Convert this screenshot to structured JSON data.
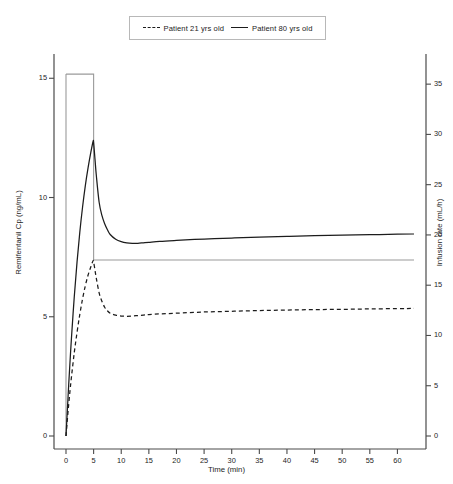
{
  "legend": {
    "position": "top-center",
    "entries": [
      {
        "label": "Patient 21 yrs old",
        "style": "dashed"
      },
      {
        "label": "Patient 80 yrs old",
        "style": "solid"
      }
    ]
  },
  "axes": {
    "x": {
      "label": "Time (min)",
      "ticks": [
        "0",
        "5",
        "10",
        "15",
        "20",
        "25",
        "30",
        "35",
        "40",
        "45",
        "50",
        "55",
        "60"
      ],
      "min": 0,
      "max": 63
    },
    "y_left": {
      "label": "Remifentanil Cp (ng/mL)",
      "ticks": [
        "0",
        "5",
        "10",
        "15"
      ],
      "min": 0,
      "max": 15.85
    },
    "y_right": {
      "label": "Infusion rate (mL/h)",
      "ticks": [
        "0",
        "5",
        "10",
        "15",
        "20",
        "25",
        "30",
        "35"
      ],
      "min": 0,
      "max": 37.6
    }
  },
  "colors": {
    "curve": "#1c1c1c",
    "infusion": "#9a9a9a",
    "axis": "#4a4a4a",
    "legend_border": "#b8b8b8",
    "background": "#ffffff"
  },
  "chart_data": {
    "type": "line",
    "title": "",
    "xlabel": "Time (min)",
    "ylabel": "Remifentanil Cp (ng/mL)",
    "ylabel_secondary": "Infusion rate (mL/h)",
    "xlim": [
      0,
      63
    ],
    "ylim": [
      0,
      15.85
    ],
    "ylim_secondary": [
      0,
      37.6
    ],
    "grid": false,
    "legend_position": "top-center",
    "series": [
      {
        "name": "Patient 80 yrs old",
        "style": "solid",
        "axis": "left",
        "units": "ng/mL",
        "x": [
          0,
          0.25,
          0.5,
          0.75,
          1,
          1.5,
          2,
          2.5,
          3,
          3.5,
          4,
          4.5,
          4.9,
          5,
          5.25,
          5.5,
          6,
          6.5,
          7,
          7.5,
          8,
          9,
          10,
          11,
          12,
          13,
          14,
          15,
          17,
          20,
          25,
          30,
          35,
          40,
          45,
          50,
          55,
          60,
          63
        ],
        "y": [
          0,
          1.1,
          2.2,
          3.2,
          4.15,
          5.85,
          7.3,
          8.55,
          9.6,
          10.5,
          11.25,
          11.9,
          12.35,
          12.3,
          11.6,
          10.9,
          9.8,
          9.25,
          8.9,
          8.65,
          8.45,
          8.25,
          8.15,
          8.1,
          8.08,
          8.08,
          8.1,
          8.12,
          8.16,
          8.2,
          8.26,
          8.3,
          8.34,
          8.37,
          8.4,
          8.42,
          8.44,
          8.46,
          8.47
        ]
      },
      {
        "name": "Patient 21 yrs old",
        "style": "dashed",
        "axis": "left",
        "units": "ng/mL",
        "x": [
          0,
          0.25,
          0.5,
          0.75,
          1,
          1.5,
          2,
          2.5,
          3,
          3.5,
          4,
          4.5,
          4.9,
          5,
          5.25,
          5.5,
          6,
          6.5,
          7,
          7.5,
          8,
          9,
          10,
          11,
          12,
          13,
          14,
          15,
          17,
          20,
          25,
          30,
          35,
          40,
          45,
          50,
          55,
          60,
          63
        ],
        "y": [
          0,
          0.7,
          1.35,
          1.95,
          2.5,
          3.5,
          4.35,
          5.1,
          5.75,
          6.3,
          6.75,
          7.1,
          7.35,
          7.3,
          6.95,
          6.6,
          6.0,
          5.65,
          5.4,
          5.25,
          5.15,
          5.07,
          5.03,
          5.02,
          5.03,
          5.05,
          5.07,
          5.09,
          5.12,
          5.15,
          5.2,
          5.23,
          5.26,
          5.28,
          5.3,
          5.31,
          5.33,
          5.34,
          5.35
        ]
      },
      {
        "name": "Infusion rate",
        "style": "step",
        "axis": "right",
        "units": "mL/h",
        "x": [
          0,
          5,
          5,
          63
        ],
        "y": [
          36.0,
          36.0,
          17.5,
          17.5
        ],
        "description": "Bolus infusion 36 mL/h for first 5 min, then maintenance 17.5 mL/h"
      }
    ],
    "annotations": {
      "peak_80yrs": {
        "x": 5,
        "y": 12.35
      },
      "peak_21yrs": {
        "x": 5,
        "y": 7.35
      },
      "plateau_80yrs": 8.45,
      "plateau_21yrs": 5.33
    }
  }
}
